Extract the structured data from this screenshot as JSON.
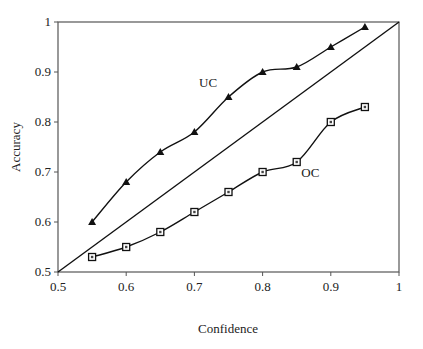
{
  "chart_data": {
    "type": "line",
    "title": "",
    "xlabel": "Confidence",
    "ylabel": "Accuracy",
    "xlim": [
      0.5,
      1
    ],
    "ylim": [
      0.5,
      1
    ],
    "xticks": [
      "0.5",
      "0.6",
      "0.7",
      "0.8",
      "0.9",
      "1"
    ],
    "yticks": [
      "0.5",
      "0.6",
      "0.7",
      "0.8",
      "0.9",
      "1"
    ],
    "grid": false,
    "legend": "inline labels",
    "x": [
      0.55,
      0.6,
      0.65,
      0.7,
      0.75,
      0.8,
      0.85,
      0.9,
      0.95
    ],
    "series": [
      {
        "name": "UC",
        "marker": "triangle",
        "values": [
          0.6,
          0.68,
          0.74,
          0.78,
          0.85,
          0.9,
          0.91,
          0.95,
          0.99
        ]
      },
      {
        "name": "OC",
        "marker": "square",
        "values": [
          0.53,
          0.55,
          0.58,
          0.62,
          0.66,
          0.7,
          0.72,
          0.8,
          0.83
        ]
      },
      {
        "name": "diagonal",
        "marker": "none",
        "x": [
          0.5,
          1
        ],
        "values": [
          0.5,
          1
        ]
      }
    ],
    "annotations": [
      {
        "text": "UC",
        "x": 0.72,
        "y": 0.87
      },
      {
        "text": "OC",
        "x": 0.87,
        "y": 0.69
      }
    ]
  }
}
